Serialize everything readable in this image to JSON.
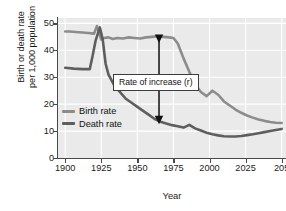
{
  "chart_data": {
    "type": "line",
    "title": "",
    "xlabel": "Year",
    "ylabel_line1": "Birth or death rate",
    "ylabel_line2": "per 1,000 population",
    "xlim": [
      1895,
      2053
    ],
    "ylim": [
      0,
      52
    ],
    "xticks": [
      "1900",
      "1925",
      "1950",
      "1975",
      "2000",
      "2025",
      "205"
    ],
    "xtick_values": [
      1900,
      1925,
      1950,
      1975,
      2000,
      2025,
      2050
    ],
    "yticks": [
      "0",
      "10",
      "20",
      "30",
      "40",
      "50"
    ],
    "ytick_values": [
      0,
      10,
      20,
      30,
      40,
      50
    ],
    "grid": true,
    "grid_color": "#ffffff",
    "plot_background": "#eaeaea",
    "legend_position": "inner-left",
    "annotation": {
      "text": "Rate  of increase (r)",
      "arrow": "double-headed vertical arrow at about 1965 spanning between the birth rate and death rate curves"
    },
    "series": [
      {
        "name": "Birth rate",
        "color": "#8c8c8c",
        "x": [
          1900,
          1903,
          1907,
          1912,
          1916,
          1920,
          1922,
          1925,
          1927,
          1930,
          1933,
          1936,
          1940,
          1944,
          1948,
          1952,
          1956,
          1960,
          1964,
          1968,
          1972,
          1975,
          1978,
          1982,
          1986,
          1990,
          1994,
          1998,
          2002,
          2006,
          2010,
          2014,
          2018,
          2022,
          2026,
          2030,
          2034,
          2038,
          2042,
          2046,
          2050
        ],
        "y": [
          47.0,
          47.0,
          46.8,
          46.6,
          46.4,
          46.2,
          49.0,
          44.0,
          44.6,
          44.8,
          44.2,
          44.6,
          44.4,
          44.8,
          44.6,
          44.4,
          44.8,
          45.0,
          45.2,
          45.0,
          44.8,
          44.6,
          42.5,
          37.0,
          32.0,
          27.5,
          24.5,
          23.0,
          25.0,
          23.5,
          21.0,
          19.5,
          18.0,
          16.8,
          15.8,
          15.0,
          14.3,
          13.8,
          13.4,
          13.1,
          13.0
        ]
      },
      {
        "name": "Death rate",
        "color": "#5e5e5e",
        "x": [
          1900,
          1906,
          1912,
          1917,
          1919,
          1921,
          1924,
          1926,
          1928,
          1930,
          1934,
          1938,
          1942,
          1946,
          1950,
          1954,
          1958,
          1962,
          1966,
          1970,
          1974,
          1978,
          1982,
          1986,
          1990,
          1994,
          1998,
          2002,
          2006,
          2010,
          2014,
          2018,
          2022,
          2026,
          2030,
          2034,
          2038,
          2042,
          2046,
          2050
        ],
        "y": [
          33.5,
          33.2,
          33.0,
          33.0,
          38.0,
          43.5,
          48.5,
          44.0,
          35.0,
          31.0,
          27.0,
          24.5,
          22.0,
          20.5,
          19.0,
          17.5,
          16.0,
          14.5,
          13.5,
          12.8,
          12.2,
          11.8,
          11.3,
          12.3,
          11.0,
          10.2,
          9.4,
          8.8,
          8.4,
          8.1,
          8.0,
          8.0,
          8.2,
          8.5,
          8.8,
          9.2,
          9.6,
          10.0,
          10.4,
          10.8
        ]
      }
    ]
  },
  "legend": {
    "items": [
      {
        "label": "Birth rate",
        "color": "#8c8c8c"
      },
      {
        "label": "Death rate",
        "color": "#5e5e5e"
      }
    ]
  }
}
